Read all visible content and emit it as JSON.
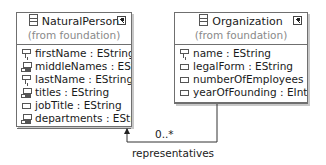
{
  "classes": [
    {
      "name": "NaturalPerson",
      "from": "(from foundation)",
      "attributes": [
        {
          "icon": "key-attribute-icon",
          "text": "firstName : EString"
        },
        {
          "icon": "multi-attribute-icon",
          "text": "middleNames : EString"
        },
        {
          "icon": "key-attribute-icon",
          "text": "lastName : EString"
        },
        {
          "icon": "multi-attribute-icon",
          "text": "titles : EString"
        },
        {
          "icon": "attribute-icon",
          "text": "jobTitle : EString"
        },
        {
          "icon": "multi-attribute-icon",
          "text": "departments : EString"
        }
      ]
    },
    {
      "name": "Organization",
      "from": "(from foundation)",
      "attributes": [
        {
          "icon": "key-attribute-icon",
          "text": "name : EString"
        },
        {
          "icon": "attribute-icon",
          "text": "legalForm : EString"
        },
        {
          "icon": "attribute-icon",
          "text": "numberOfEmployees : EInt"
        },
        {
          "icon": "attribute-icon",
          "text": "yearOfFounding : EInt"
        }
      ]
    }
  ],
  "association": {
    "source": "Organization",
    "target": "NaturalPerson",
    "multiplicity": "0..*",
    "role": "representatives"
  }
}
